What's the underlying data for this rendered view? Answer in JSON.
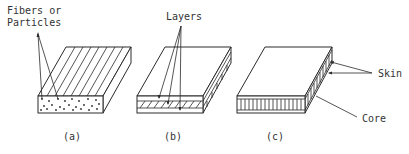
{
  "figure": {
    "panels": [
      {
        "id": "a",
        "caption": "(a)",
        "label_lines": [
          "Fibers or",
          "Particles"
        ]
      },
      {
        "id": "b",
        "caption": "(b)",
        "label": "Layers"
      },
      {
        "id": "c",
        "caption": "(c)",
        "labels": {
          "skin": "Skin",
          "core": "Core"
        }
      }
    ]
  },
  "colors": {
    "line": "#2a2a2a",
    "text": "#333333",
    "background": "#ffffff"
  }
}
